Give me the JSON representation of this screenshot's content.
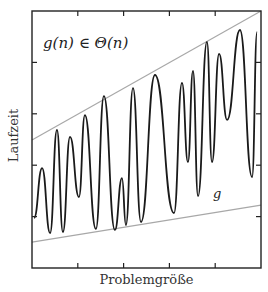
{
  "chart_data": {
    "type": "line",
    "title": "",
    "annotation": "g(n) ∈ Θ(n)",
    "xlabel": "Problemgröße",
    "ylabel": "Laufzeit",
    "xlim": [
      0,
      1
    ],
    "ylim": [
      0,
      1
    ],
    "grid": false,
    "legend": null,
    "x_ticks_count": 4,
    "y_ticks_count": 4,
    "colors": {
      "curve": "#1a1a1a",
      "bounds": "#a8a8a8",
      "axes": "#222222"
    },
    "series": [
      {
        "name": "g",
        "label": "g",
        "style": "oscillating curve",
        "points": [
          [
            0.009,
            0.195
          ],
          [
            0.044,
            0.389
          ],
          [
            0.079,
            0.136
          ],
          [
            0.109,
            0.537
          ],
          [
            0.135,
            0.14
          ],
          [
            0.166,
            0.51
          ],
          [
            0.205,
            0.276
          ],
          [
            0.231,
            0.595
          ],
          [
            0.279,
            0.152
          ],
          [
            0.314,
            0.669
          ],
          [
            0.362,
            0.148
          ],
          [
            0.393,
            0.35
          ],
          [
            0.41,
            0.167
          ],
          [
            0.441,
            0.7
          ],
          [
            0.476,
            0.179
          ],
          [
            0.537,
            0.751
          ],
          [
            0.62,
            0.214
          ],
          [
            0.655,
            0.72
          ],
          [
            0.681,
            0.412
          ],
          [
            0.703,
            0.767
          ],
          [
            0.725,
            0.28
          ],
          [
            0.764,
            0.88
          ],
          [
            0.786,
            0.412
          ],
          [
            0.817,
            0.833
          ],
          [
            0.852,
            0.576
          ],
          [
            0.908,
            0.926
          ],
          [
            0.961,
            0.354
          ],
          [
            0.983,
            0.918
          ]
        ]
      },
      {
        "name": "upper bound",
        "label": "c2·n",
        "style": "straight line",
        "points": [
          [
            0,
            0.498
          ],
          [
            1,
            1.0
          ]
        ]
      },
      {
        "name": "lower bound",
        "label": "c1·n",
        "style": "straight line",
        "points": [
          [
            0,
            0.101
          ],
          [
            1,
            0.245
          ]
        ]
      }
    ]
  },
  "labels": {
    "annotation": "g(n) ∈ Θ(n)",
    "curve": "g",
    "xlabel": "Problemgröße",
    "ylabel": "Laufzeit"
  }
}
